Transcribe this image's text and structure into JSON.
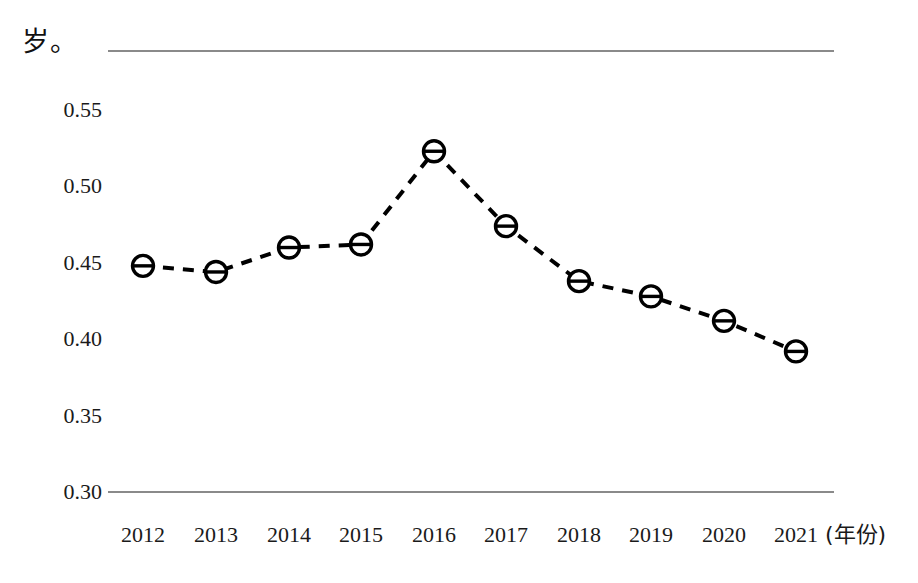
{
  "chart_data": {
    "type": "line",
    "title": "",
    "subtitle": "",
    "xlabel": "(年份)",
    "ylabel": "岁。",
    "categories": [
      "2012",
      "2013",
      "2014",
      "2015",
      "2016",
      "2017",
      "2018",
      "2019",
      "2020",
      "2021"
    ],
    "values": [
      0.448,
      0.444,
      0.46,
      0.462,
      0.523,
      0.474,
      0.438,
      0.428,
      0.412,
      0.392
    ],
    "series": [
      {
        "name": "",
        "values": [
          0.448,
          0.444,
          0.46,
          0.462,
          0.523,
          0.474,
          0.438,
          0.428,
          0.412,
          0.392
        ]
      }
    ],
    "ylim": [
      0.3,
      0.55
    ],
    "yticks": [
      "0.30",
      "0.35",
      "0.40",
      "0.45",
      "0.50",
      "0.55"
    ],
    "ytick_values": [
      0.3,
      0.35,
      0.4,
      0.45,
      0.5,
      0.55
    ],
    "grid": false,
    "legend": "none",
    "line_style": "dashed",
    "line_color": "#000000",
    "marker": "circle-with-horizontal-line",
    "marker_color": "#000000",
    "axis_color": "#8a8a8a"
  },
  "axes": {
    "y_label_text": "岁。",
    "x_unit_text": "(年份)"
  }
}
